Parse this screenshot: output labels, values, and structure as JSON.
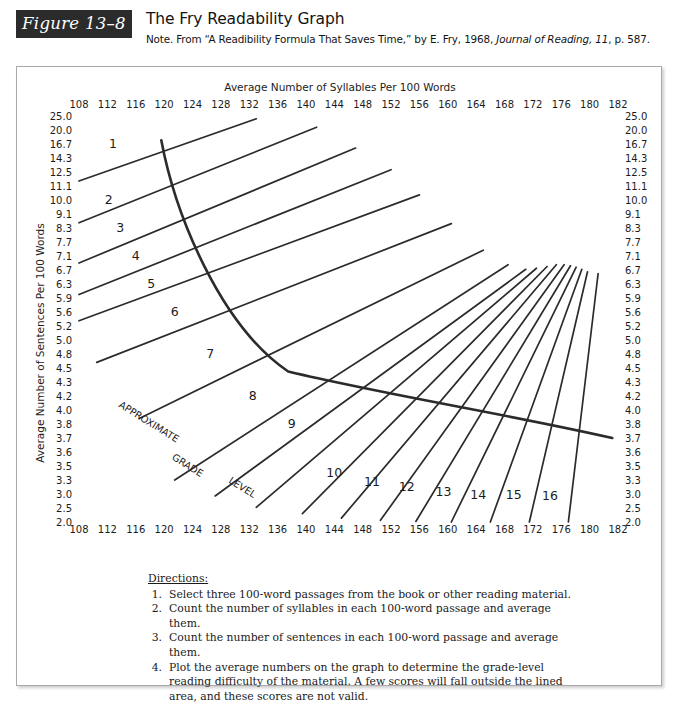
{
  "header": {
    "badge": "Figure 13–8",
    "title": "The Fry Readability Graph",
    "note_prefix": "Note. From “A Readibility Formula That Saves Time,” by E. Fry, 1968, ",
    "note_italic": "Journal of Reading, 11",
    "note_suffix": ", p. 587."
  },
  "chart_data": {
    "type": "line",
    "title": "The Fry Readability Graph",
    "xlabel": "Average Number of Syllables Per 100 Words",
    "ylabel": "Average Number of Sentences Per 100 Words",
    "grid": false,
    "legend": false,
    "x_ticks": [
      108,
      112,
      116,
      120,
      124,
      128,
      132,
      136,
      140,
      144,
      148,
      152,
      156,
      160,
      164,
      168,
      172,
      176,
      180,
      182
    ],
    "y_ticks": [
      25.0,
      20.0,
      16.7,
      14.3,
      12.5,
      11.1,
      10.0,
      9.1,
      8.3,
      7.7,
      7.1,
      6.7,
      6.3,
      5.9,
      5.6,
      5.2,
      5.0,
      4.8,
      4.5,
      4.3,
      4.2,
      4.0,
      3.8,
      3.7,
      3.6,
      3.5,
      3.3,
      3.0,
      2.5,
      2.0
    ],
    "xlim": [
      108,
      182
    ],
    "ylim_labels_top": "25.0",
    "ylim_labels_bottom": "2.0",
    "grade_labels": [
      "1",
      "2",
      "3",
      "4",
      "5",
      "6",
      "7",
      "8",
      "9",
      "10",
      "11",
      "12",
      "13",
      "14",
      "15",
      "16"
    ],
    "region_annotation": [
      "APPROXIMATE",
      "GRADE",
      "LEVEL"
    ]
  },
  "directions": {
    "heading": "Directions:",
    "items": [
      {
        "num": "1.",
        "text": "Select three 100-word passages from the book or other reading material."
      },
      {
        "num": "2.",
        "text": "Count the number of syllables in each 100-word passage and average them."
      },
      {
        "num": "3.",
        "text": "Count the number of sentences in each 100-word passage and average them."
      },
      {
        "num": "4.",
        "text": "Plot the average numbers on the graph to determine the grade-level reading difficulty of the material. A few scores will fall outside the lined area, and these scores are not valid."
      }
    ]
  },
  "colors": {
    "badge_bg": "#2b2b2b",
    "line": "#2b2b2b",
    "text": "#1a1a1a",
    "frame_border": "#aaaaaa"
  }
}
